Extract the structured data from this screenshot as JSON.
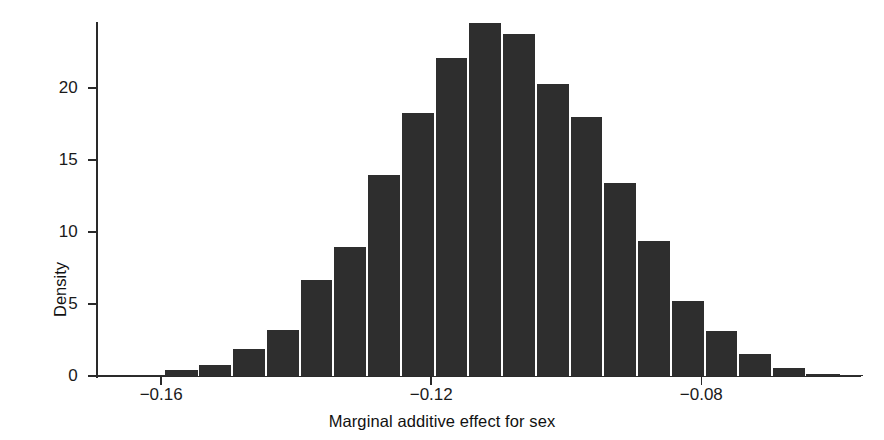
{
  "chart_data": {
    "type": "bar",
    "subtype": "histogram",
    "title": "",
    "xlabel": "Marginal additive effect for sex",
    "ylabel": "Density",
    "xlim": [
      -0.1695,
      -0.0565
    ],
    "ylim": [
      0,
      24.6
    ],
    "grid": false,
    "legend": null,
    "bar_color": "#2e2e2e",
    "axis_color": "#2a2a2a",
    "background": "#ffffff",
    "bin_width": 0.005,
    "xticks": [
      -0.16,
      -0.12,
      -0.08
    ],
    "xticklabels": [
      "−0.16",
      "−0.12",
      "−0.08"
    ],
    "yticks": [
      0,
      5,
      10,
      15,
      20
    ],
    "yticklabels": [
      "0",
      "5",
      "10",
      "15",
      "20"
    ],
    "bin_centers": [
      -0.167,
      -0.162,
      -0.157,
      -0.152,
      -0.147,
      -0.142,
      -0.137,
      -0.132,
      -0.127,
      -0.122,
      -0.117,
      -0.112,
      -0.107,
      -0.102,
      -0.097,
      -0.092,
      -0.087,
      -0.082,
      -0.077,
      -0.072,
      -0.067,
      -0.062,
      -0.0585
    ],
    "values": [
      0.0,
      0.05,
      0.4,
      0.8,
      1.9,
      3.2,
      6.7,
      9.0,
      14.0,
      18.3,
      22.1,
      24.5,
      23.8,
      20.3,
      18.0,
      13.4,
      9.4,
      5.2,
      3.1,
      1.5,
      0.55,
      0.15,
      0.05
    ],
    "categories": [
      "-0.167",
      "-0.162",
      "-0.157",
      "-0.152",
      "-0.147",
      "-0.142",
      "-0.137",
      "-0.132",
      "-0.127",
      "-0.122",
      "-0.117",
      "-0.112",
      "-0.107",
      "-0.102",
      "-0.097",
      "-0.092",
      "-0.087",
      "-0.082",
      "-0.077",
      "-0.072",
      "-0.067",
      "-0.062",
      "-0.0585"
    ],
    "peak_value": 24.5,
    "peak_bin_center": -0.112
  },
  "axis_titles": {
    "x": "Marginal additive effect for sex",
    "y": "Density"
  }
}
